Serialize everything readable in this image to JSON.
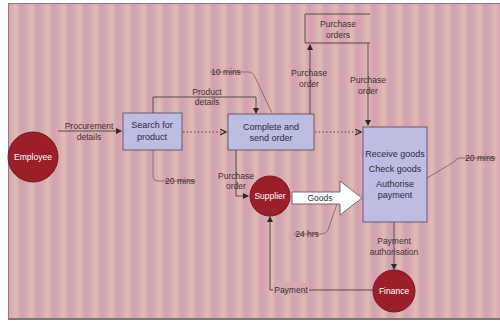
{
  "colors": {
    "background": "#d9aab2",
    "process_box": "#bcbde0",
    "entity_circle": "#9a1f2a",
    "line": "#4a3f44",
    "goods_arrow": "#ffffff"
  },
  "entities": {
    "employee": "Employee",
    "supplier": "Supplier",
    "finance": "Finance"
  },
  "processes": {
    "search": {
      "line1": "Search for",
      "line2": "product"
    },
    "complete": {
      "line1": "Complete and",
      "line2": "send order"
    },
    "receive": {
      "line1": "Receive goods",
      "line2": "Check goods",
      "line3": "Authorise",
      "line4": "payment"
    }
  },
  "data_store": {
    "line1": "Purchase",
    "line2": "orders"
  },
  "flows": {
    "procurement": {
      "line1": "Procurement",
      "line2": "details"
    },
    "product_details": {
      "line1": "Product",
      "line2": "details"
    },
    "po_to_store": {
      "line1": "Purchase",
      "line2": "order"
    },
    "po_from_store": {
      "line1": "Purchase",
      "line2": "order"
    },
    "po_to_supplier": {
      "line1": "Purchase",
      "line2": "order"
    },
    "goods": "Goods",
    "payment_authorisation": {
      "line1": "Payment",
      "line2": "authorisation"
    },
    "payment": "Payment"
  },
  "time_tags": {
    "search_time": "20 mins",
    "complete_time": "10 mins",
    "receive_time": "20 mins",
    "delivery_time": "24 hrs"
  }
}
